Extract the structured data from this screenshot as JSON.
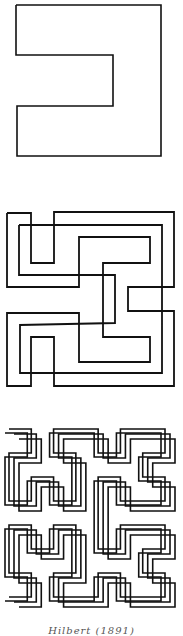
{
  "figure": {
    "type": "space-filling curve iterations",
    "stroke_color": "#111111",
    "background": "#ffffff",
    "panels": [
      {
        "id": "order-1",
        "stroke_width": 1.6,
        "paths": [
          [
            [
              16,
              5
            ],
            [
              161,
              5
            ],
            [
              161,
              156
            ],
            [
              17,
              156
            ],
            [
              17,
              106
            ],
            [
              113,
              106
            ],
            [
              113,
              55
            ],
            [
              16,
              55
            ],
            [
              16,
              5
            ]
          ]
        ]
      },
      {
        "id": "order-2",
        "stroke_width": 1.8,
        "paths": [
          [
            [
              7,
              213
            ],
            [
              31,
              213
            ],
            [
              31,
              263
            ],
            [
              54,
              263
            ],
            [
              54,
              212
            ],
            [
              174,
              212
            ],
            [
              174,
              287
            ],
            [
              128,
              287
            ],
            [
              128,
              311
            ],
            [
              174,
              311
            ],
            [
              174,
              386
            ],
            [
              54,
              386
            ],
            [
              54,
              337
            ],
            [
              31,
              337
            ],
            [
              31,
              386
            ],
            [
              7,
              386
            ],
            [
              7,
              313
            ],
            [
              79,
              313
            ],
            [
              79,
              362
            ],
            [
              150,
              362
            ],
            [
              150,
              337
            ],
            [
              103,
              337
            ],
            [
              103,
              263
            ],
            [
              150,
              263
            ],
            [
              150,
              237
            ],
            [
              79,
              237
            ],
            [
              79,
              287
            ],
            [
              7,
              287
            ],
            [
              7,
              213
            ]
          ],
          [
            [
              19,
              225
            ],
            [
              162,
              225
            ],
            [
              162,
              373
            ],
            [
              20,
              373
            ],
            [
              20,
              325
            ],
            [
              115,
              323
            ],
            [
              115,
              275
            ],
            [
              19,
              275
            ],
            [
              19,
              225
            ]
          ]
        ]
      },
      {
        "id": "order-3",
        "stroke_width": 1.6,
        "generated": "hilbert",
        "order": 3,
        "box": [
          4,
          424,
          176,
          188
        ],
        "offsets": [
          [
            0,
            0
          ],
          [
            5,
            5
          ],
          [
            10,
            10
          ],
          [
            -4,
            4
          ]
        ]
      }
    ]
  },
  "caption": {
    "text": "Hilbert (1891)"
  }
}
